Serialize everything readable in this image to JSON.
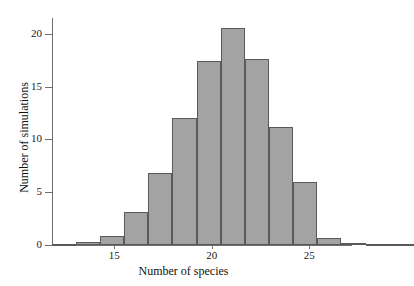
{
  "chart_data": {
    "type": "bar",
    "title": "",
    "subtitle": "",
    "xlabel": "Number of species",
    "ylabel": "Number of simulations",
    "xlim": [
      11.8,
      27.2
    ],
    "ylim": [
      0,
      21.5
    ],
    "xticks": [
      15,
      20,
      25
    ],
    "xtick_labels": [
      "15",
      "20",
      "25"
    ],
    "yticks": [
      0,
      5,
      10,
      15,
      20
    ],
    "ytick_labels": [
      "0",
      "5",
      "10",
      "15",
      "20"
    ],
    "grid": false,
    "legend": null,
    "bin_width": 1.24,
    "bar_color": "#a3a3a3",
    "bar_edge_color": "#5a5a5a",
    "axis_color": "#6f6f6f",
    "categories": [
      "12.4",
      "13.0",
      "13.7",
      "14.3",
      "15.0",
      "15.7",
      "16.3",
      "17.0",
      "18.2",
      "18.8",
      "19.5",
      "20.1",
      "21.4",
      "22.0",
      "22.7"
    ],
    "bin_centers": [
      12.4,
      13.0,
      13.7,
      14.3,
      15.0,
      15.7,
      16.3,
      17.0,
      18.2,
      18.8,
      19.5,
      20.1,
      21.4,
      22.0,
      22.7
    ],
    "values": [
      0.1,
      0.3,
      0.85,
      3.1,
      6.8,
      12.0,
      17.4,
      20.6,
      17.6,
      11.2,
      6.0,
      0.7,
      0.2,
      0.1,
      0.05
    ],
    "annotations": []
  }
}
